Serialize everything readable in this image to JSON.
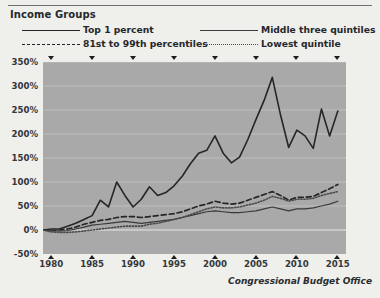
{
  "legend": {
    "title": "Income Groups",
    "entries": [
      {
        "label": "Top 1 percent",
        "style": "solid-thick",
        "color": "#262626",
        "col": 1,
        "row": 1
      },
      {
        "label": "81st to 99th percentiles",
        "style": "dashed",
        "color": "#262626",
        "col": 1,
        "row": 2
      },
      {
        "label": "Middle three quintiles",
        "style": "solid-thin",
        "color": "#3a3a3a",
        "col": 2,
        "row": 1
      },
      {
        "label": "Lowest quintile",
        "style": "dotted",
        "color": "#4a4a4a",
        "col": 2,
        "row": 2
      }
    ]
  },
  "credit": "Congressional Budget Office",
  "chart_data": {
    "type": "line",
    "title": "Income Groups",
    "xlabel": "",
    "ylabel": "",
    "xlim": [
      1979,
      2016
    ],
    "ylim": [
      -50,
      350
    ],
    "grid": true,
    "legend_position": "top",
    "plot_background": "#a9a9a9",
    "y_ticks": [
      "-50%",
      "0%",
      "50%",
      "100%",
      "150%",
      "200%",
      "250%",
      "300%",
      "350%"
    ],
    "y_tick_values": [
      -50,
      0,
      50,
      100,
      150,
      200,
      250,
      300,
      350
    ],
    "x_ticks": [
      "1980",
      "1985",
      "1990",
      "1995",
      "2000",
      "2005",
      "2010",
      "2015"
    ],
    "x_tick_values": [
      1980,
      1985,
      1990,
      1995,
      2000,
      2005,
      2010,
      2015
    ],
    "x": [
      1979,
      1980,
      1981,
      1982,
      1983,
      1984,
      1985,
      1986,
      1987,
      1988,
      1989,
      1990,
      1991,
      1992,
      1993,
      1994,
      1995,
      1996,
      1997,
      1998,
      1999,
      2000,
      2001,
      2002,
      2003,
      2004,
      2005,
      2006,
      2007,
      2008,
      2009,
      2010,
      2011,
      2012,
      2013,
      2014,
      2015
    ],
    "series": [
      {
        "name": "Top 1 percent",
        "style": "solid-thick",
        "color": "#262626",
        "values": [
          0,
          2,
          2,
          8,
          14,
          22,
          30,
          62,
          48,
          100,
          72,
          48,
          64,
          90,
          72,
          78,
          92,
          112,
          138,
          160,
          166,
          196,
          160,
          140,
          152,
          188,
          230,
          270,
          318,
          240,
          172,
          208,
          196,
          170,
          252,
          196,
          248
        ]
      },
      {
        "name": "81st to 99th percentiles",
        "style": "dashed",
        "color": "#262626",
        "values": [
          0,
          -1,
          0,
          2,
          6,
          12,
          16,
          20,
          22,
          26,
          28,
          28,
          26,
          28,
          30,
          32,
          34,
          38,
          44,
          50,
          54,
          60,
          56,
          54,
          56,
          62,
          68,
          74,
          80,
          72,
          62,
          68,
          68,
          70,
          78,
          86,
          95
        ]
      },
      {
        "name": "Middle three quintiles",
        "style": "solid-thin",
        "color": "#3a3a3a",
        "values": [
          0,
          -2,
          -2,
          -1,
          2,
          6,
          10,
          12,
          14,
          16,
          18,
          16,
          14,
          16,
          18,
          20,
          22,
          26,
          30,
          34,
          38,
          40,
          38,
          36,
          36,
          38,
          40,
          44,
          48,
          44,
          40,
          44,
          44,
          46,
          50,
          54,
          60
        ]
      },
      {
        "name": "Lowest quintile",
        "style": "dotted",
        "color": "#4a4a4a",
        "values": [
          0,
          -4,
          -5,
          -5,
          -4,
          -2,
          0,
          2,
          4,
          6,
          8,
          8,
          8,
          12,
          14,
          18,
          22,
          26,
          32,
          38,
          44,
          48,
          46,
          46,
          48,
          52,
          56,
          62,
          70,
          66,
          60,
          64,
          64,
          66,
          72,
          76,
          80
        ]
      }
    ]
  }
}
